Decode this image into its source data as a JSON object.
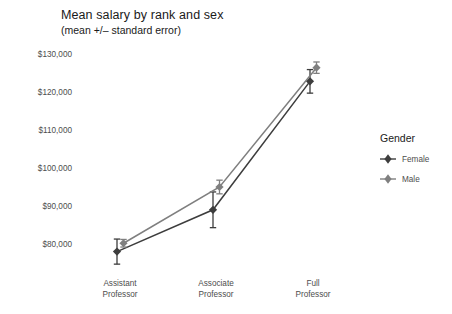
{
  "chart_data": {
    "type": "line",
    "title": "Mean salary by rank and sex",
    "subtitle": "(mean +/– standard error)",
    "xlabel": "",
    "ylabel": "",
    "categories": [
      "Assistant\nProfessor",
      "Associate\nProfessor",
      "Full\nProfessor"
    ],
    "category_labels": [
      {
        "line1": "Assistant",
        "line2": "Professor"
      },
      {
        "line1": "Associate",
        "line2": "Professor"
      },
      {
        "line1": "Full",
        "line2": "Professor"
      }
    ],
    "ylim": [
      74000,
      132000
    ],
    "yticks": [
      80000,
      90000,
      100000,
      110000,
      120000,
      130000
    ],
    "ytick_labels": [
      "$80,000",
      "$90,000",
      "$100,000",
      "$110,000",
      "$120,000",
      "$130,000"
    ],
    "grid": false,
    "legend_position": "right",
    "legend_title": "Gender",
    "series": [
      {
        "name": "Female",
        "color": "#3d3d3d",
        "values": [
          78000,
          89000,
          122800
        ],
        "errors": [
          3300,
          4700,
          3100
        ]
      },
      {
        "name": "Male",
        "color": "#7f7f7f",
        "values": [
          80200,
          95000,
          126400
        ],
        "errors": [
          1000,
          1800,
          1500
        ]
      }
    ]
  },
  "legend": {
    "title": "Gender",
    "items": [
      {
        "label": "Female",
        "color": "#3d3d3d"
      },
      {
        "label": "Male",
        "color": "#7f7f7f"
      }
    ]
  },
  "colors": {
    "background": "#ffffff",
    "text": "#4d4d4d",
    "title": "#1a1a1a",
    "female": "#3d3d3d",
    "male": "#7f7f7f"
  }
}
